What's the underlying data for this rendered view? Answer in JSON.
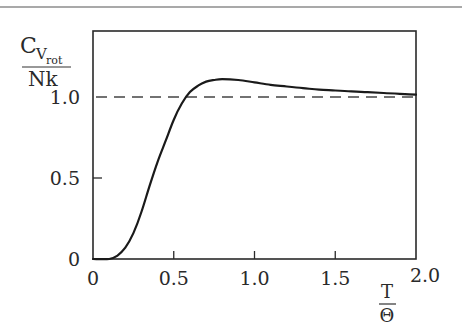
{
  "chart_data": {
    "type": "line",
    "title": "",
    "xlabel": {
      "numerator": "T",
      "denominator": "Θ"
    },
    "ylabel": {
      "numerator": "C",
      "sub1": "V",
      "sub2": "rot",
      "denominator": "Nk"
    },
    "xlim": [
      0,
      2.0
    ],
    "ylim": [
      0,
      1.2
    ],
    "x_ticks": [
      0,
      0.5,
      1.0,
      1.5,
      2.0
    ],
    "x_tick_labels": [
      "0",
      "0.5",
      "1.0",
      "1.5",
      "2.0"
    ],
    "y_ticks": [
      0,
      0.5,
      1.0
    ],
    "y_tick_labels": [
      "0",
      "0.5",
      "1.0"
    ],
    "grid": false,
    "reference_line": {
      "y": 1.0,
      "style": "dashed"
    },
    "series": [
      {
        "name": "C_Vrot/Nk",
        "x": [
          0,
          0.1,
          0.15,
          0.2,
          0.25,
          0.3,
          0.35,
          0.4,
          0.45,
          0.5,
          0.55,
          0.6,
          0.65,
          0.7,
          0.75,
          0.8,
          0.9,
          1.0,
          1.1,
          1.2,
          1.3,
          1.4,
          1.5,
          1.6,
          1.7,
          1.8,
          1.9,
          2.0
        ],
        "values": [
          0,
          0.0,
          0.02,
          0.07,
          0.16,
          0.29,
          0.45,
          0.6,
          0.73,
          0.86,
          0.96,
          1.03,
          1.07,
          1.095,
          1.105,
          1.11,
          1.105,
          1.09,
          1.075,
          1.065,
          1.055,
          1.045,
          1.04,
          1.035,
          1.03,
          1.025,
          1.02,
          1.015
        ]
      }
    ]
  }
}
